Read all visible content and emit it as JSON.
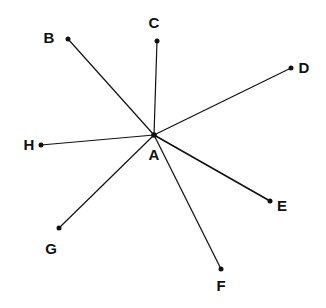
{
  "diagram": {
    "type": "radial line segments from a common point",
    "center": {
      "id": "A",
      "label": "A",
      "x": 154,
      "y": 135,
      "label_x": 154,
      "label_y": 160
    },
    "points": [
      {
        "id": "B",
        "label": "B",
        "x": 68,
        "y": 39,
        "label_x": 49,
        "label_y": 43
      },
      {
        "id": "C",
        "label": "C",
        "x": 157,
        "y": 41,
        "label_x": 154,
        "label_y": 28
      },
      {
        "id": "D",
        "label": "D",
        "x": 291,
        "y": 68,
        "label_x": 304,
        "label_y": 73
      },
      {
        "id": "E",
        "label": "E",
        "x": 270,
        "y": 201,
        "label_x": 282,
        "label_y": 211
      },
      {
        "id": "F",
        "label": "F",
        "x": 221,
        "y": 269,
        "label_x": 221,
        "label_y": 291
      },
      {
        "id": "G",
        "label": "G",
        "x": 59,
        "y": 228,
        "label_x": 51,
        "label_y": 254
      },
      {
        "id": "H",
        "label": "H",
        "x": 41,
        "y": 145,
        "label_x": 29,
        "label_y": 150
      }
    ],
    "segments": [
      "AB",
      "AC",
      "AD",
      "AE",
      "AF",
      "AG",
      "AH"
    ],
    "colors": {
      "line": "#111111",
      "background": "#ffffff"
    }
  }
}
